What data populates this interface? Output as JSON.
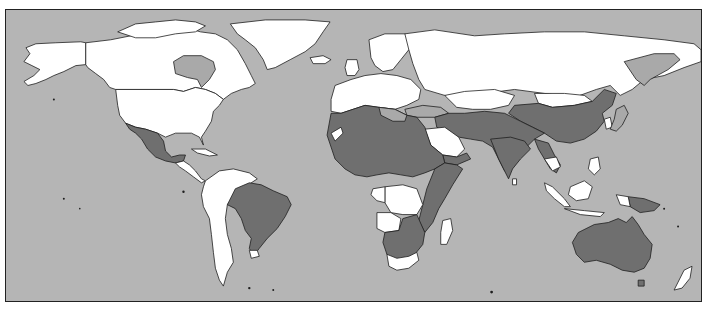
{
  "map": {
    "type": "choropleth-world",
    "projection": "equirectangular (cropped, no Antarctica)",
    "colors": {
      "ocean": "#b5b5b5",
      "category_dark": "#6f6f6f",
      "category_light": "#a9a9a9",
      "category_white": "#ffffff",
      "border": "#1e1e1e",
      "frame": "#222222"
    },
    "legend": null,
    "title": null,
    "regions": {
      "dark": [
        "Mexico",
        "Guatemala",
        "Brazil",
        "Morocco",
        "Algeria",
        "Tunisia",
        "Libya",
        "Egypt",
        "Mauritania",
        "Mali",
        "Niger",
        "Chad",
        "Sudan",
        "Ethiopia",
        "Somalia",
        "Kenya",
        "West Africa",
        "Tanzania",
        "Mozambique",
        "Zambia",
        "Zimbabwe",
        "Namibia",
        "Botswana",
        "Iran",
        "Iraq",
        "Syria",
        "Afghanistan",
        "Pakistan",
        "India",
        "China",
        "Myanmar",
        "Australia",
        "Papua New Guinea",
        "Yemen"
      ],
      "light": [
        "Western Sahara",
        "Turkey",
        "Georgia/Armenia/Azerbaijan",
        "Japan",
        "Russian Far East",
        "Greenland coastal",
        "Hudson Bay region",
        "Baltic/Finland parts",
        "Oman"
      ],
      "white": [
        "Canada",
        "United States",
        "Greenland",
        "Colombia",
        "Venezuela",
        "Peru",
        "Bolivia",
        "Chile",
        "Argentina",
        "Paraguay",
        "Uruguay",
        "Western Europe",
        "Scandinavia",
        "Russia",
        "Kazakhstan",
        "Mongolia",
        "Saudi Arabia",
        "DR Congo",
        "Angola",
        "South Africa",
        "Madagascar",
        "Thailand",
        "Indonesia",
        "Philippines",
        "New Zealand"
      ]
    }
  }
}
